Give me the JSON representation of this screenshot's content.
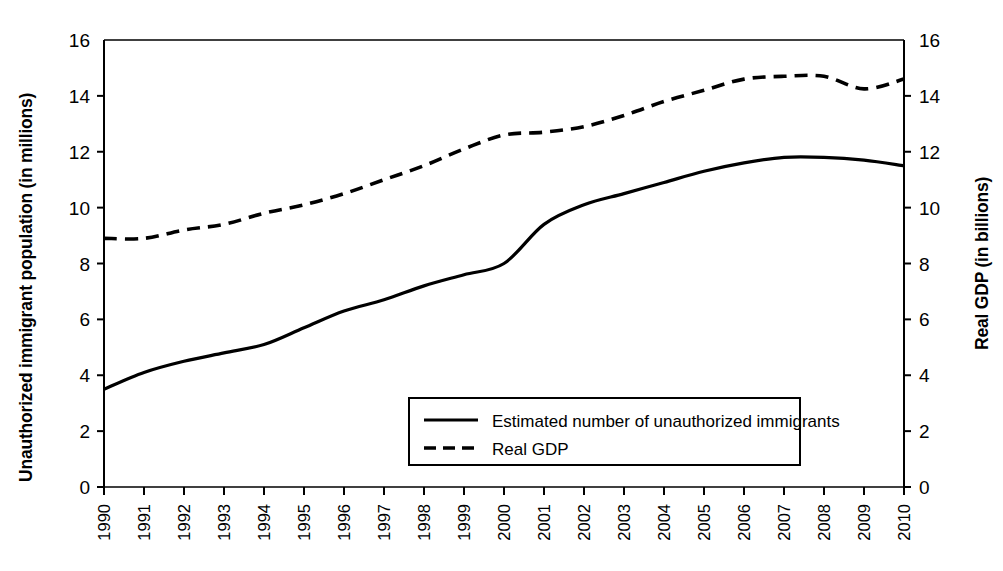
{
  "chart_data": {
    "type": "line",
    "title": "",
    "xlabel": "",
    "x": [
      "1990",
      "1991",
      "1992",
      "1993",
      "1994",
      "1995",
      "1996",
      "1997",
      "1998",
      "1999",
      "2000",
      "2001",
      "2002",
      "2003",
      "2004",
      "2005",
      "2006",
      "2007",
      "2008",
      "2009",
      "2010"
    ],
    "grid": false,
    "legend_position": "inside-bottom-center",
    "axes": {
      "left": {
        "label": "Unauthorized immigrant population (in millions)",
        "ticks": [
          "0",
          "2",
          "4",
          "6",
          "8",
          "10",
          "12",
          "14",
          "16"
        ],
        "tick_values": [
          0,
          2,
          4,
          6,
          8,
          10,
          12,
          14,
          16
        ],
        "ylim": [
          0,
          16
        ]
      },
      "right": {
        "label": "Real GDP (in billions)",
        "ticks": [
          "0",
          "2",
          "4",
          "6",
          "8",
          "10",
          "12",
          "14",
          "16"
        ],
        "tick_values": [
          0,
          2,
          4,
          6,
          8,
          10,
          12,
          14,
          16
        ],
        "ylim": [
          0,
          16
        ]
      }
    },
    "series": [
      {
        "name": "Estimated number of unauthorized immigrants",
        "axis": "left",
        "style": "solid",
        "color": "#000000",
        "values": [
          3.5,
          4.1,
          4.5,
          4.8,
          5.1,
          5.7,
          6.3,
          6.7,
          7.2,
          7.6,
          8.0,
          9.4,
          10.1,
          10.5,
          10.9,
          11.3,
          11.6,
          11.8,
          11.8,
          11.7,
          11.5
        ]
      },
      {
        "name": "Real GDP",
        "axis": "right",
        "style": "dashed",
        "color": "#000000",
        "values": [
          8.9,
          8.9,
          9.2,
          9.4,
          9.8,
          10.1,
          10.5,
          11.0,
          11.5,
          12.1,
          12.6,
          12.7,
          12.9,
          13.3,
          13.8,
          14.2,
          14.6,
          14.7,
          14.7,
          14.25,
          14.6
        ]
      }
    ]
  },
  "legend": {
    "items": [
      {
        "label": "Estimated number of unauthorized immigrants",
        "style": "solid"
      },
      {
        "label": "Real GDP",
        "style": "dashed"
      }
    ]
  },
  "colors": {
    "ink": "#000000",
    "background": "#ffffff"
  }
}
